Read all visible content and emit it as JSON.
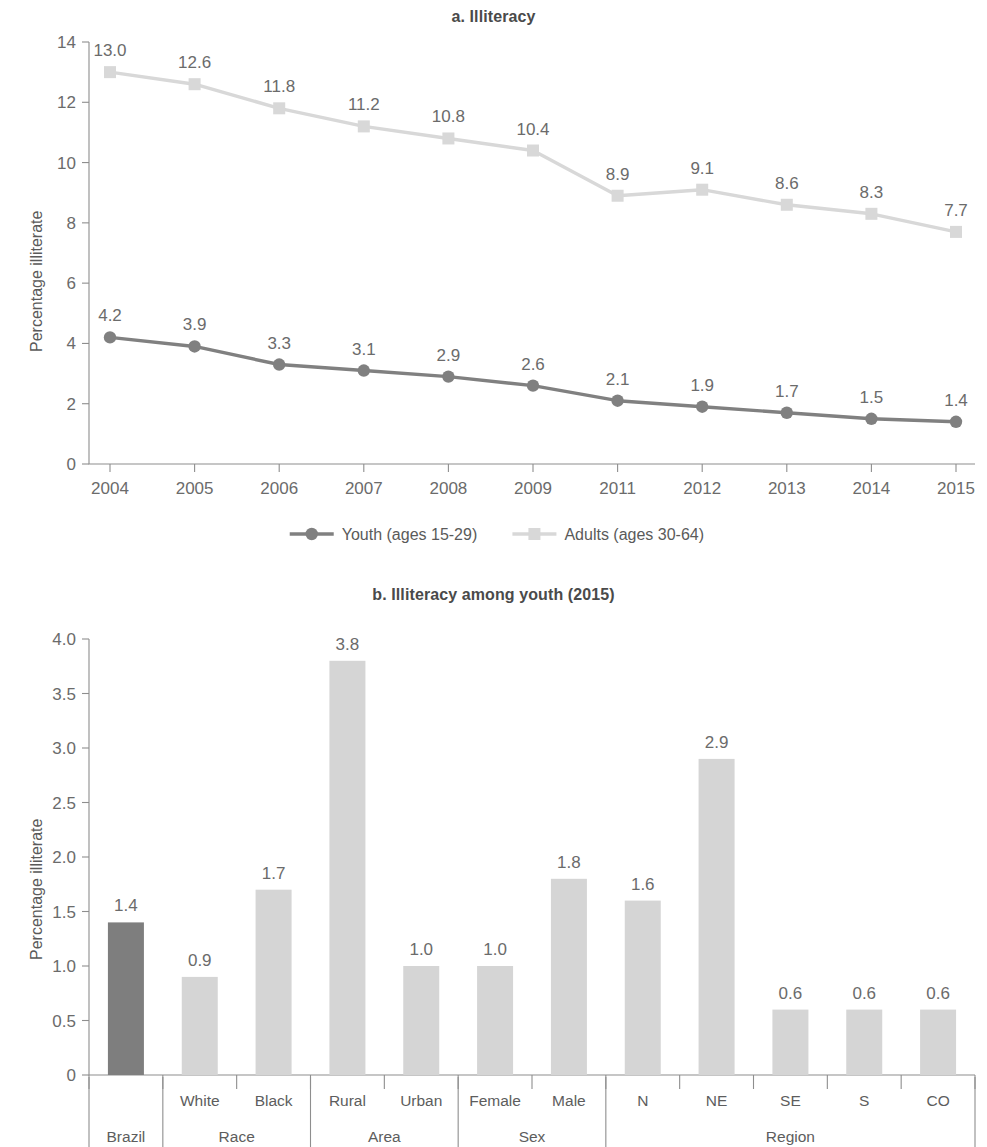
{
  "figure": {
    "panel_a_title": "a. Illiteracy",
    "panel_b_title": "b. Illiteracy among youth (2015)",
    "ylabel_a": "Percentage illiterate",
    "ylabel_b": "Percentage illiterate"
  },
  "legend": {
    "items": [
      {
        "label": "Youth (ages 15-29)",
        "marker": "circle",
        "color": "#808080"
      },
      {
        "label": "Adults (ages 30-64)",
        "marker": "square",
        "color": "#d8d8d8"
      }
    ]
  },
  "axes": {
    "a_yticks": [
      "0",
      "2",
      "4",
      "6",
      "8",
      "10",
      "12",
      "14"
    ],
    "a_xticks": [
      "2004",
      "2005",
      "2006",
      "2007",
      "2008",
      "2009",
      "2011",
      "2012",
      "2013",
      "2014",
      "2015"
    ],
    "b_yticks": [
      "0",
      "0.5",
      "1.0",
      "1.5",
      "2.0",
      "2.5",
      "3.0",
      "3.5",
      "4.0"
    ]
  },
  "colors": {
    "youth_line": "#808080",
    "adults_line": "#d8d8d8",
    "bar_highlight": "#7e7e7e",
    "bar_default": "#d5d5d5",
    "axis": "#8e8e8e",
    "text": "#5a5a5a"
  },
  "chart_data": [
    {
      "type": "line",
      "title": "a. Illiteracy",
      "xlabel": "",
      "ylabel": "Percentage illiterate",
      "ylim": [
        0,
        14
      ],
      "ytick_step": 2,
      "grid": false,
      "legend_position": "bottom",
      "categories": [
        "2004",
        "2005",
        "2006",
        "2007",
        "2008",
        "2009",
        "2011",
        "2012",
        "2013",
        "2014",
        "2015"
      ],
      "series": [
        {
          "name": "Youth (ages 15-29)",
          "color": "#808080",
          "marker": "circle",
          "values": [
            4.2,
            3.9,
            3.3,
            3.1,
            2.9,
            2.6,
            2.1,
            1.9,
            1.7,
            1.5,
            1.4
          ],
          "labels": [
            "4.2",
            "3.9",
            "3.3",
            "3.1",
            "2.9",
            "2.6",
            "2.1",
            "1.9",
            "1.7",
            "1.5",
            "1.4"
          ]
        },
        {
          "name": "Adults (ages 30-64)",
          "color": "#d8d8d8",
          "marker": "square",
          "values": [
            13.0,
            12.6,
            11.8,
            11.2,
            10.8,
            10.4,
            8.9,
            9.1,
            8.6,
            8.3,
            7.7
          ],
          "labels": [
            "13.0",
            "12.6",
            "11.8",
            "11.2",
            "10.8",
            "10.4",
            "8.9",
            "9.1",
            "8.6",
            "8.3",
            "7.7"
          ]
        }
      ]
    },
    {
      "type": "bar",
      "title": "b. Illiteracy among youth (2015)",
      "xlabel": "",
      "ylabel": "Percentage illiterate",
      "ylim": [
        0,
        4.0
      ],
      "ytick_step": 0.5,
      "grid": false,
      "categories": [
        "Brazil",
        "White",
        "Black",
        "Rural",
        "Urban",
        "Female",
        "Male",
        "N",
        "NE",
        "SE",
        "S",
        "CO"
      ],
      "values": [
        1.4,
        0.9,
        1.7,
        3.8,
        1.0,
        1.0,
        1.8,
        1.6,
        2.9,
        0.6,
        0.6,
        0.6
      ],
      "labels": [
        "1.4",
        "0.9",
        "1.7",
        "3.8",
        "1.0",
        "1.0",
        "1.8",
        "1.6",
        "2.9",
        "0.6",
        "0.6",
        "0.6"
      ],
      "highlight_index": 0,
      "groups": [
        {
          "label": "Brazil",
          "members": [
            "Brazil"
          ],
          "show_member_labels": false
        },
        {
          "label": "Race",
          "members": [
            "White",
            "Black"
          ],
          "show_member_labels": true
        },
        {
          "label": "Area",
          "members": [
            "Rural",
            "Urban"
          ],
          "show_member_labels": true
        },
        {
          "label": "Sex",
          "members": [
            "Female",
            "Male"
          ],
          "show_member_labels": true
        },
        {
          "label": "Region",
          "members": [
            "N",
            "NE",
            "SE",
            "S",
            "CO"
          ],
          "show_member_labels": true
        }
      ]
    }
  ]
}
